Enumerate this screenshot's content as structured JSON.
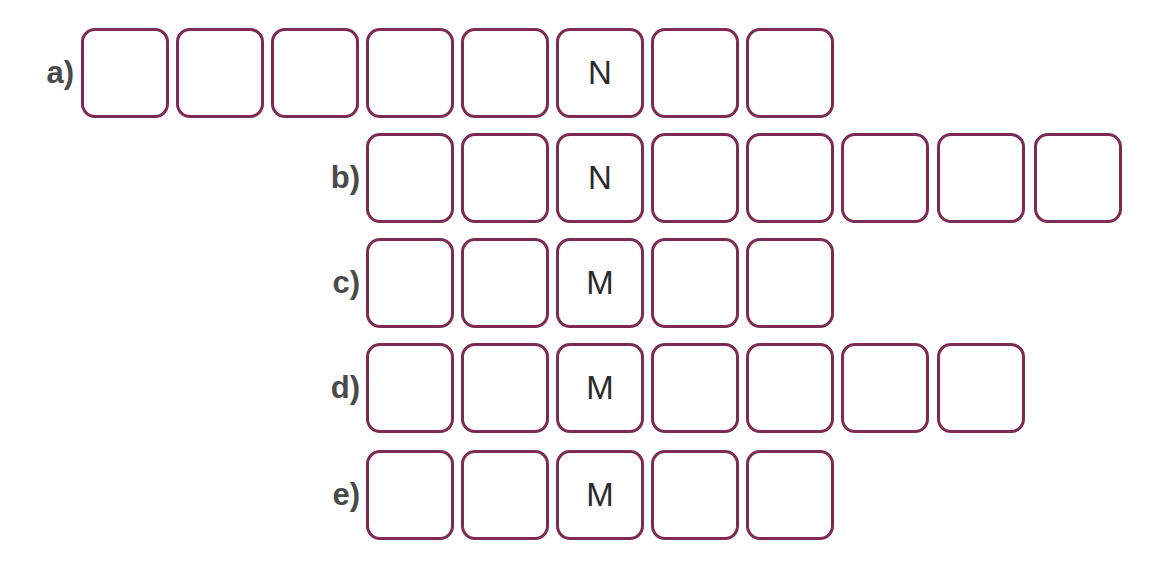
{
  "puzzle": {
    "style": {
      "box_border_color": "#7d2a55",
      "label_color": "#4a4a4a",
      "letter_color": "#2b2b2b",
      "background": "#ffffff"
    },
    "rows": [
      {
        "label": "a)",
        "box_count": 8,
        "cells": [
          "",
          "",
          "",
          "",
          "",
          "N",
          "",
          ""
        ],
        "given_letter": "N",
        "given_position": 6
      },
      {
        "label": "b)",
        "box_count": 8,
        "cells": [
          "",
          "",
          "N",
          "",
          "",
          "",
          "",
          ""
        ],
        "given_letter": "N",
        "given_position": 3
      },
      {
        "label": "c)",
        "box_count": 5,
        "cells": [
          "",
          "",
          "M",
          "",
          ""
        ],
        "given_letter": "M",
        "given_position": 3
      },
      {
        "label": "d)",
        "box_count": 7,
        "cells": [
          "",
          "",
          "M",
          "",
          "",
          "",
          ""
        ],
        "given_letter": "M",
        "given_position": 3
      },
      {
        "label": "e)",
        "box_count": 5,
        "cells": [
          "",
          "",
          "M",
          "",
          ""
        ],
        "given_letter": "M",
        "given_position": 3
      }
    ]
  }
}
